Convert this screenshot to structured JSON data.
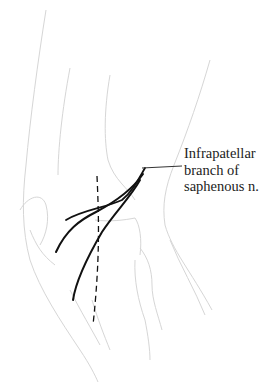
{
  "figure": {
    "label": {
      "lines": [
        "Infrapatellar",
        "branch of",
        "saphenous n."
      ]
    },
    "colors": {
      "outline": "#d4d4d4",
      "nerve": "#111111",
      "text": "#222222",
      "background": "#ffffff"
    }
  }
}
